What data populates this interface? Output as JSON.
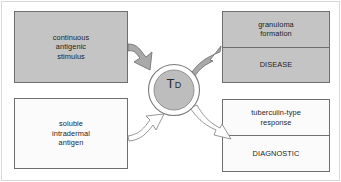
{
  "diagram": {
    "hub": {
      "label_main": "T",
      "label_sub": "D",
      "fill_color": "#bdbdbd",
      "ring_color": "#7a7a7a"
    },
    "inputs": [
      {
        "id": "continuous-antigenic-stimulus",
        "text": "continuous\nantigenic\nstimulus",
        "fill": "#c4c4c4",
        "style": "shaded"
      },
      {
        "id": "soluble-intradermal-antigen",
        "text": "soluble\nintradermal\nantigen",
        "fill": "#fbfbfb",
        "style": "plain"
      }
    ],
    "outputs": [
      {
        "id": "granuloma-disease",
        "fill": "#c4c4c4",
        "style": "shaded",
        "cells": [
          {
            "id": "granuloma-formation",
            "text": "granuloma\nformation"
          },
          {
            "id": "disease",
            "text": "DISEASE"
          }
        ]
      },
      {
        "id": "tuberculin-diagnostic",
        "fill": "#fbfbfb",
        "style": "plain",
        "cells": [
          {
            "id": "tuberculin-type-response",
            "text": "tuberculin-type\nresponse"
          },
          {
            "id": "diagnostic",
            "text": "DIAGNOSTIC"
          }
        ]
      }
    ],
    "arrows": [
      {
        "id": "arrow-continuous-to-hub",
        "style": "filled",
        "fill": "#a9a9a9",
        "direction": "down-right"
      },
      {
        "id": "arrow-hub-to-granuloma",
        "style": "filled",
        "fill": "#a9a9a9",
        "direction": "up-right"
      },
      {
        "id": "arrow-soluble-to-hub",
        "style": "hollow",
        "fill": "#ffffff",
        "direction": "up-right"
      },
      {
        "id": "arrow-hub-to-tuberculin",
        "style": "hollow",
        "fill": "#ffffff",
        "direction": "down-right"
      }
    ],
    "border_color": "#6f6f6f",
    "frame_color": "#d8d8d8"
  }
}
